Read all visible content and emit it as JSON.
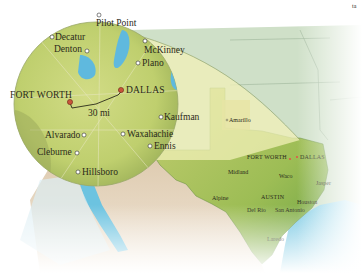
{
  "map": {
    "corner_mark": "ta",
    "inset": {
      "scale_label": "30 mi",
      "major_cities": [
        {
          "name": "FORT WORTH"
        },
        {
          "name": "DALLAS"
        }
      ],
      "towns": [
        {
          "name": "Pilot Point"
        },
        {
          "name": "Decatur"
        },
        {
          "name": "Denton"
        },
        {
          "name": "McKinney"
        },
        {
          "name": "Plano"
        },
        {
          "name": "Kaufman"
        },
        {
          "name": "Alvarado"
        },
        {
          "name": "Waxahachie"
        },
        {
          "name": "Ennis"
        },
        {
          "name": "Cleburne"
        },
        {
          "name": "Hillsboro"
        }
      ]
    },
    "state": {
      "major_cities": [
        {
          "name": "FORT WORTH"
        },
        {
          "name": "DALLAS"
        },
        {
          "name": "AUSTIN"
        }
      ],
      "towns": [
        {
          "name": "Amarillo"
        },
        {
          "name": "Midland"
        },
        {
          "name": "Waco"
        },
        {
          "name": "Jasper"
        },
        {
          "name": "Alpine"
        },
        {
          "name": "Houston"
        },
        {
          "name": "Del Rio"
        },
        {
          "name": "San Antonio"
        },
        {
          "name": "Laredo"
        }
      ]
    },
    "colors": {
      "major_city_marker": "#c8553a",
      "state_city_marker": "#e0564a",
      "water": "#6cc3e0",
      "land_green": "#a9c25a",
      "neighbor_states": "#cfe0c8",
      "desert": "#e6d6bf",
      "inset_fill": "#c9d67a",
      "highlight": "#f2f0b8"
    }
  }
}
